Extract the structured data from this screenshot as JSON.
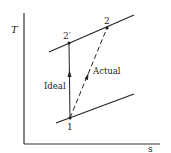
{
  "diagram": {
    "type": "T-s diagram",
    "axes": {
      "y_label": "T",
      "x_label": "s"
    },
    "points": {
      "p1": "1",
      "p2": "2",
      "p2prime": "2′"
    },
    "paths": {
      "ideal_label": "Ideal",
      "actual_label": "Actual"
    },
    "colors": {
      "line": "#222222",
      "background": "#ffffff"
    }
  }
}
